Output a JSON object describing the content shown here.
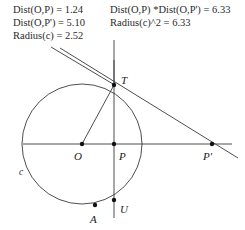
{
  "canvas": {
    "width": 245,
    "height": 230,
    "background": "#ffffff",
    "stroke_color": "#3a3a3a",
    "text_color": "#2b2b2b"
  },
  "annotations": {
    "left_block": {
      "lines": [
        "Dist(O,P) = 1.24",
        "Dist(O,P') = 5.10",
        "Radius(c) = 2.52"
      ]
    },
    "right_block": {
      "lines": [
        "Dist(O,P) *Dist(O,P') = 6.33",
        "Radius(c)^2 = 6.33"
      ]
    }
  },
  "measurements": {
    "dist_O_P": 1.24,
    "dist_O_Pprime": 5.1,
    "radius_c": 2.52,
    "product_dist": 6.33,
    "radius_squared": 6.33
  },
  "figure": {
    "circle": {
      "name": "c",
      "center": {
        "x": 82,
        "y": 144
      },
      "radius": 60
    },
    "points": [
      {
        "id": "O",
        "label": "O",
        "x": 82,
        "y": 144,
        "label_x": 74,
        "label_y": 150,
        "dot": true
      },
      {
        "id": "P",
        "label": "P",
        "x": 114,
        "y": 144,
        "label_x": 119,
        "label_y": 150,
        "dot": true
      },
      {
        "id": "Pp",
        "label": "P'",
        "x": 212,
        "y": 144,
        "label_x": 203,
        "label_y": 150,
        "dot": true
      },
      {
        "id": "T",
        "label": "T",
        "x": 114,
        "y": 85,
        "label_x": 121,
        "label_y": 74,
        "dot": true
      },
      {
        "id": "U",
        "label": "U",
        "x": 114,
        "y": 200,
        "label_x": 120,
        "label_y": 203,
        "dot": true
      },
      {
        "id": "A",
        "label": "A",
        "x": 95,
        "y": 205,
        "label_x": 90,
        "label_y": 213,
        "dot": true
      }
    ],
    "circle_label": {
      "text": "c",
      "x": 19,
      "y": 167
    },
    "segments": [
      {
        "id": "axis-horizontal",
        "x1": 23,
        "y1": 144,
        "x2": 232,
        "y2": 144
      },
      {
        "id": "chord-vertical",
        "x1": 114,
        "y1": 60,
        "x2": 114,
        "y2": 218
      },
      {
        "id": "radius-OT",
        "x1": 82,
        "y1": 144,
        "x2": 114,
        "y2": 85
      },
      {
        "id": "tangent-T-Pp",
        "x1": 60,
        "y1": 48,
        "x2": 238,
        "y2": 158
      }
    ],
    "leader_lines": [
      {
        "id": "leader-left",
        "x1": 51,
        "y1": 47,
        "x2": 113,
        "y2": 84
      },
      {
        "id": "leader-right",
        "x1": 114,
        "y1": 40,
        "x2": 114,
        "y2": 84
      }
    ]
  }
}
